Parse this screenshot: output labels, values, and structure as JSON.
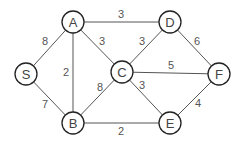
{
  "graph": {
    "type": "weighted-undirected-graph",
    "node_radius": 11,
    "colors": {
      "background": "#ffffff",
      "edge": "#555555",
      "node_stroke": "#222222",
      "node_fill": "#ffffff",
      "node_text": "#444444",
      "edge_text": "#555555"
    },
    "nodes": [
      {
        "id": "S",
        "label": "S",
        "x": 26,
        "y": 74
      },
      {
        "id": "A",
        "label": "A",
        "x": 73,
        "y": 22
      },
      {
        "id": "B",
        "label": "B",
        "x": 73,
        "y": 123
      },
      {
        "id": "C",
        "label": "C",
        "x": 122,
        "y": 72
      },
      {
        "id": "D",
        "label": "D",
        "x": 170,
        "y": 22
      },
      {
        "id": "E",
        "label": "E",
        "x": 170,
        "y": 123
      },
      {
        "id": "F",
        "label": "F",
        "x": 219,
        "y": 74
      }
    ],
    "edges": [
      {
        "from": "S",
        "to": "A",
        "weight": "8",
        "lx": 45,
        "ly": 41
      },
      {
        "from": "S",
        "to": "B",
        "weight": "7",
        "lx": 45,
        "ly": 104
      },
      {
        "from": "A",
        "to": "B",
        "weight": "2",
        "lx": 66,
        "ly": 72
      },
      {
        "from": "A",
        "to": "D",
        "weight": "3",
        "lx": 121,
        "ly": 14
      },
      {
        "from": "A",
        "to": "C",
        "weight": "3",
        "lx": 102,
        "ly": 41
      },
      {
        "from": "B",
        "to": "C",
        "weight": "8",
        "lx": 100,
        "ly": 87
      },
      {
        "from": "B",
        "to": "E",
        "weight": "2",
        "lx": 121,
        "ly": 131
      },
      {
        "from": "C",
        "to": "D",
        "weight": "3",
        "lx": 142,
        "ly": 41
      },
      {
        "from": "C",
        "to": "F",
        "weight": "5",
        "lx": 171,
        "ly": 65
      },
      {
        "from": "C",
        "to": "E",
        "weight": "3",
        "lx": 142,
        "ly": 85
      },
      {
        "from": "D",
        "to": "F",
        "weight": "6",
        "lx": 197,
        "ly": 41
      },
      {
        "from": "E",
        "to": "F",
        "weight": "4",
        "lx": 198,
        "ly": 103
      }
    ]
  }
}
